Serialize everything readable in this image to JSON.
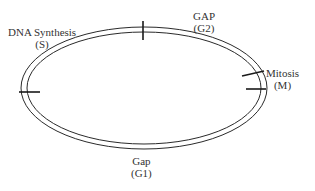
{
  "diagram": {
    "colors": {
      "line": "#2a2a2a",
      "text": "#333333",
      "background": "#ffffff"
    },
    "phases": [
      {
        "id": "s",
        "name": "DNA Synthesis",
        "abbr": "(S)"
      },
      {
        "id": "g2",
        "name": "GAP",
        "abbr": "(G2)"
      },
      {
        "id": "m",
        "name": "Mitosis",
        "abbr": "(M)"
      },
      {
        "id": "g1",
        "name": "Gap",
        "abbr": "(G1)"
      }
    ]
  }
}
